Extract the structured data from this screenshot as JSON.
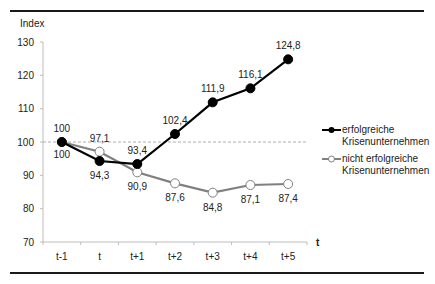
{
  "chart_data": {
    "type": "line",
    "title": "",
    "xlabel": "t",
    "ylabel": "Index",
    "categories": [
      "t-1",
      "t",
      "t+1",
      "t+2",
      "t+3",
      "t+4",
      "t+5"
    ],
    "yticks": [
      70,
      80,
      90,
      100,
      110,
      120,
      130
    ],
    "ylim": [
      70,
      130
    ],
    "reference_line": 100,
    "grid": false,
    "legend_position": "right",
    "series": [
      {
        "name": "erfolgreiche Krisenunternehmen",
        "legend_lines": [
          "erfolgreiche",
          "Krisenunternehmen"
        ],
        "values": [
          100,
          94.3,
          93.4,
          102.4,
          111.9,
          116.1,
          124.8
        ],
        "labels": [
          "100",
          "94,3",
          "93,4",
          "102,4",
          "111,9",
          "116,1",
          "124,8"
        ],
        "color": "#000000",
        "marker": "filled-circle"
      },
      {
        "name": "nicht erfolgreiche Krisenunternehmen",
        "legend_lines": [
          "nicht erfolgreiche",
          "Krisenunternehmen"
        ],
        "values": [
          100,
          97.1,
          90.9,
          87.6,
          84.8,
          87.1,
          87.4
        ],
        "labels": [
          "100",
          "97,1",
          "90,9",
          "87,6",
          "84,8",
          "87,1",
          "87,4"
        ],
        "color": "#808080",
        "marker": "open-circle"
      }
    ]
  }
}
